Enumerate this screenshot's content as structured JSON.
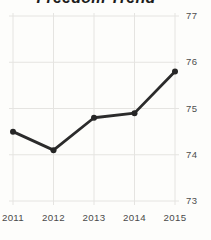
{
  "chart": {
    "title": "Freedom Trend",
    "colors": {
      "line": "#2b2b2b",
      "marker": "#262626",
      "grid": "#e5e4e1",
      "tick_label": "#4d4d4d",
      "title": "#1c1c1c",
      "background": "#fdfdfb"
    }
  },
  "chart_data": {
    "type": "line",
    "title": "Freedom Trend",
    "x": [
      "2011",
      "2012",
      "2013",
      "2014",
      "2015"
    ],
    "series": [
      {
        "name": "Freedom Trend",
        "values": [
          74.5,
          74.1,
          74.8,
          74.9,
          75.8
        ]
      }
    ],
    "xlabel": "",
    "ylabel": "",
    "ylim": [
      73,
      77
    ],
    "yticks": [
      "77",
      "76",
      "75",
      "74",
      "73"
    ],
    "ytick_values": [
      77,
      76,
      75,
      74,
      73
    ],
    "y_axis_side": "right",
    "grid": "on",
    "legend": "none",
    "markers": "filled-circle"
  }
}
